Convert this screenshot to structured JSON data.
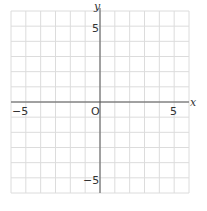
{
  "graph": {
    "x_axis_label": "x",
    "y_axis_label": "y",
    "origin_label": "O",
    "x_tick_labels": {
      "neg": "−5",
      "pos": "5"
    },
    "y_tick_labels": {
      "pos": "5",
      "neg": "−5"
    },
    "x_range": [
      -6,
      6
    ],
    "y_range": [
      -6,
      6
    ],
    "grid_step": 1,
    "colors": {
      "grid": "#dcdcdc",
      "axis": "#555555",
      "text": "#333333"
    }
  }
}
